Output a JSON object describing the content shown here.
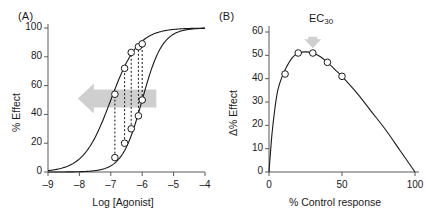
{
  "figure": {
    "panel_a_label": "(A)",
    "panel_b_label": "(B)",
    "annotation_arrow_color": "#cfcfcf",
    "curve_color": "#1a1a1a",
    "axis_color": "#595959",
    "marker_fill": "#ffffff"
  },
  "ec_annotation": {
    "prefix": "EC",
    "subscript": "30"
  },
  "chart_data": [
    {
      "type": "line",
      "panel": "(A)",
      "title": "",
      "xlabel": "Log [Agonist]",
      "ylabel": "% Effect",
      "xlim": [
        -9,
        -4
      ],
      "ylim": [
        0,
        100
      ],
      "xticks": [
        -9,
        -8,
        -7,
        -6,
        -5,
        -4
      ],
      "xtick_labels": [
        "–9",
        "–8",
        "–7",
        "–6",
        "–5",
        "–4"
      ],
      "yticks": [
        0,
        20,
        40,
        60,
        80,
        100
      ],
      "ytick_labels": [
        "0",
        "20",
        "40",
        "60",
        "80",
        "100"
      ],
      "grid": false,
      "legend": "none",
      "series": [
        {
          "name": "Control curve",
          "kind": "sigmoid",
          "logEC50": -7.0,
          "hill": 1.0,
          "emax": 100
        },
        {
          "name": "Shifted curve",
          "kind": "sigmoid",
          "logEC50": -6.0,
          "hill": 1.35,
          "emax": 100
        }
      ],
      "markers_control": [
        {
          "x": -6.87,
          "y": 54
        },
        {
          "x": -6.56,
          "y": 72
        },
        {
          "x": -6.35,
          "y": 83
        },
        {
          "x": -6.12,
          "y": 87
        },
        {
          "x": -6.0,
          "y": 89
        }
      ],
      "markers_shifted": [
        {
          "x": -6.87,
          "y": 10
        },
        {
          "x": -6.56,
          "y": 20
        },
        {
          "x": -6.35,
          "y": 30
        },
        {
          "x": -6.12,
          "y": 39
        },
        {
          "x": -6.0,
          "y": 50
        }
      ],
      "connectors": [
        {
          "x": -6.87,
          "y_low": 10,
          "y_high": 54
        },
        {
          "x": -6.56,
          "y_low": 20,
          "y_high": 72
        },
        {
          "x": -6.35,
          "y_low": 30,
          "y_high": 83
        },
        {
          "x": -6.12,
          "y_low": 39,
          "y_high": 87
        },
        {
          "x": -6.0,
          "y_low": 50,
          "y_high": 89
        }
      ],
      "annotations": [
        {
          "kind": "arrow",
          "direction": "left",
          "y": 51,
          "x_start": -5.55,
          "x_end": -8.05
        }
      ]
    },
    {
      "type": "line",
      "panel": "(B)",
      "title": "",
      "xlabel": "% Control response",
      "ylabel": "Δ% Effect",
      "xlim": [
        0,
        100
      ],
      "ylim": [
        0,
        60
      ],
      "xticks": [
        0,
        50,
        100
      ],
      "xtick_labels": [
        "0",
        "50",
        "100"
      ],
      "yticks": [
        0,
        10,
        20,
        30,
        40,
        50,
        60
      ],
      "ytick_labels": [
        "0",
        "10",
        "20",
        "30",
        "40",
        "50",
        "60"
      ],
      "grid": false,
      "legend": "none",
      "curve_points": [
        {
          "x": 0,
          "y": 0
        },
        {
          "x": 2,
          "y": 16
        },
        {
          "x": 4,
          "y": 27
        },
        {
          "x": 6,
          "y": 35
        },
        {
          "x": 9,
          "y": 41
        },
        {
          "x": 12,
          "y": 45
        },
        {
          "x": 16,
          "y": 49
        },
        {
          "x": 20,
          "y": 51
        },
        {
          "x": 25,
          "y": 51.5
        },
        {
          "x": 30,
          "y": 51
        },
        {
          "x": 35,
          "y": 49.5
        },
        {
          "x": 40,
          "y": 47
        },
        {
          "x": 45,
          "y": 44
        },
        {
          "x": 50,
          "y": 41
        },
        {
          "x": 60,
          "y": 34
        },
        {
          "x": 70,
          "y": 26
        },
        {
          "x": 80,
          "y": 18
        },
        {
          "x": 90,
          "y": 9
        },
        {
          "x": 100,
          "y": 0
        }
      ],
      "markers": [
        {
          "x": 11,
          "y": 42
        },
        {
          "x": 20,
          "y": 51
        },
        {
          "x": 30,
          "y": 51
        },
        {
          "x": 40,
          "y": 47
        },
        {
          "x": 50,
          "y": 41
        }
      ],
      "annotations": [
        {
          "kind": "arrow",
          "direction": "down",
          "x": 30,
          "y_top": 58,
          "y_bottom": 53,
          "label": "EC30"
        }
      ]
    }
  ]
}
